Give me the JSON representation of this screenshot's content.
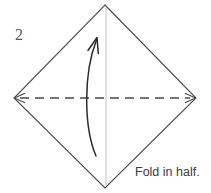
{
  "figure": {
    "step_number": "2",
    "caption": "Fold in half.",
    "colors": {
      "paper_edge": "#4a4a4a",
      "fold_line": "#4a4a4a",
      "center_guide": "#cfcfcf",
      "arrow": "#2b2b2b",
      "step_number_color": "#5a5a5a",
      "caption_color": "#3b3b3b",
      "background": "#ffffff"
    },
    "shape": {
      "name": "square-diamond",
      "vertices": {
        "top": [
          105,
          5
        ],
        "right": [
          196,
          98
        ],
        "bottom": [
          105,
          188
        ],
        "left": [
          14,
          98
        ]
      }
    },
    "fold_line": {
      "name": "horizontal-valley-fold",
      "style": "dashed",
      "from": [
        14,
        98
      ],
      "to": [
        196,
        98
      ],
      "arrowheads": "both"
    },
    "center_guide": {
      "name": "vertical-center-line",
      "style": "solid-light",
      "from": [
        106,
        8
      ],
      "to": [
        106,
        186
      ]
    },
    "motion_arrow": {
      "name": "fold-up-arrow",
      "direction": "up",
      "start": [
        96,
        156
      ],
      "end": [
        97,
        38
      ]
    }
  }
}
